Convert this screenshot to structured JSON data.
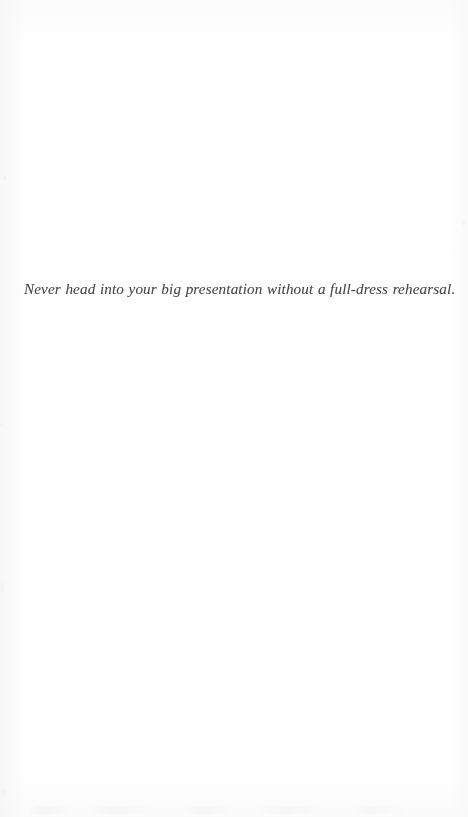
{
  "page": {
    "kind": "scanned-book-page",
    "width": 468,
    "height": 817,
    "background_color": "#fefefe",
    "text_color": "#3a3a3a"
  },
  "epigraph": {
    "text": "Never head into your big presentation without a full-dress rehearsal."
  }
}
